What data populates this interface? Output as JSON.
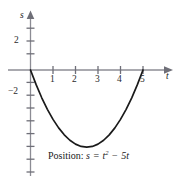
{
  "figure": {
    "caption_prefix": "Position:",
    "caption_lhs": "s",
    "caption_equals": "=",
    "caption_base": "t",
    "caption_exponent": "2",
    "caption_minus": "−",
    "caption_term": "5t",
    "curve_color": "#1a1a1a",
    "axis_color": "#8c8c94"
  },
  "axes": {
    "x_name": "t",
    "y_name": "s",
    "x_ticks": [
      "1",
      "2",
      "3",
      "4",
      "5"
    ],
    "y_ticks": [
      "2",
      "−2"
    ]
  },
  "chart_data": {
    "type": "line",
    "xlabel": "t",
    "ylabel": "s",
    "equation": "s = t^2 - 5t",
    "xlim": [
      -1,
      6
    ],
    "ylim": [
      -8,
      3
    ],
    "xticks": [
      1,
      2,
      3,
      4,
      5
    ],
    "yticks": [
      2,
      -2
    ],
    "grid": false,
    "legend": null,
    "series": [
      {
        "name": "s = t^2 - 5t",
        "x": [
          0,
          0.25,
          0.5,
          0.75,
          1,
          1.25,
          1.5,
          1.75,
          2,
          2.25,
          2.5,
          2.75,
          3,
          3.25,
          3.5,
          3.75,
          4,
          4.25,
          4.5,
          4.75,
          5
        ],
        "y": [
          0,
          -1.1875,
          -2.25,
          -3.1875,
          -4,
          -4.6875,
          -5.25,
          -5.6875,
          -6,
          -6.1875,
          -6.25,
          -6.1875,
          -6,
          -5.6875,
          -5.25,
          -4.6875,
          -4,
          -3.1875,
          -2.25,
          -1.1875,
          0
        ]
      }
    ],
    "roots": [
      0,
      5
    ],
    "vertex": [
      2.5,
      -6.25
    ]
  }
}
